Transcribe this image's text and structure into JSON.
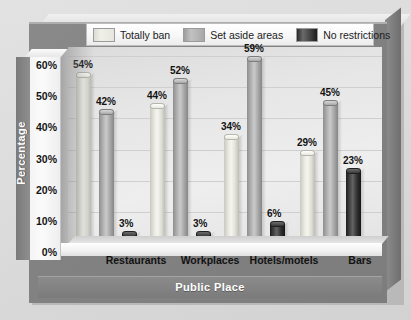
{
  "chart_data": {
    "type": "bar",
    "title": "",
    "xlabel": "Public Place",
    "ylabel": "Percentage",
    "categories": [
      "Restaurants",
      "Workplaces",
      "Hotels/motels",
      "Bars"
    ],
    "series": [
      {
        "name": "Totally ban",
        "values": [
          54,
          44,
          34,
          29
        ],
        "color": "#eeeee6"
      },
      {
        "name": "Set aside areas",
        "values": [
          42,
          52,
          59,
          45
        ],
        "color": "#b3b3b3"
      },
      {
        "name": "No restrictions",
        "values": [
          3,
          3,
          6,
          23
        ],
        "color": "#272727"
      }
    ],
    "data_labels": [
      [
        "54%",
        "44%",
        "34%",
        "29%"
      ],
      [
        "42%",
        "52%",
        "59%",
        "45%"
      ],
      [
        "3%",
        "3%",
        "6%",
        "23%"
      ]
    ],
    "ylim": [
      0,
      60
    ],
    "yticks": [
      60,
      50,
      40,
      30,
      20,
      10,
      0
    ],
    "ytick_labels": [
      "60%",
      "50%",
      "40%",
      "30%",
      "20%",
      "10%",
      "0%"
    ],
    "grid": true,
    "legend_position": "top",
    "style": "3d-cylinder"
  },
  "axes": {
    "y_title": "Percentage",
    "x_title": "Public Place"
  },
  "legend": {
    "items": [
      {
        "label": "Totally ban",
        "swatch": "legend-swatch-totally-ban"
      },
      {
        "label": "Set aside areas",
        "swatch": "legend-swatch-set-aside-areas"
      },
      {
        "label": "No restrictions",
        "swatch": "legend-swatch-no-restrictions"
      }
    ]
  },
  "colors": {
    "frame": "#828282",
    "plot_background": "#e6e6e6",
    "band": "#818181",
    "text": "#121212",
    "band_text": "#ffffff"
  }
}
